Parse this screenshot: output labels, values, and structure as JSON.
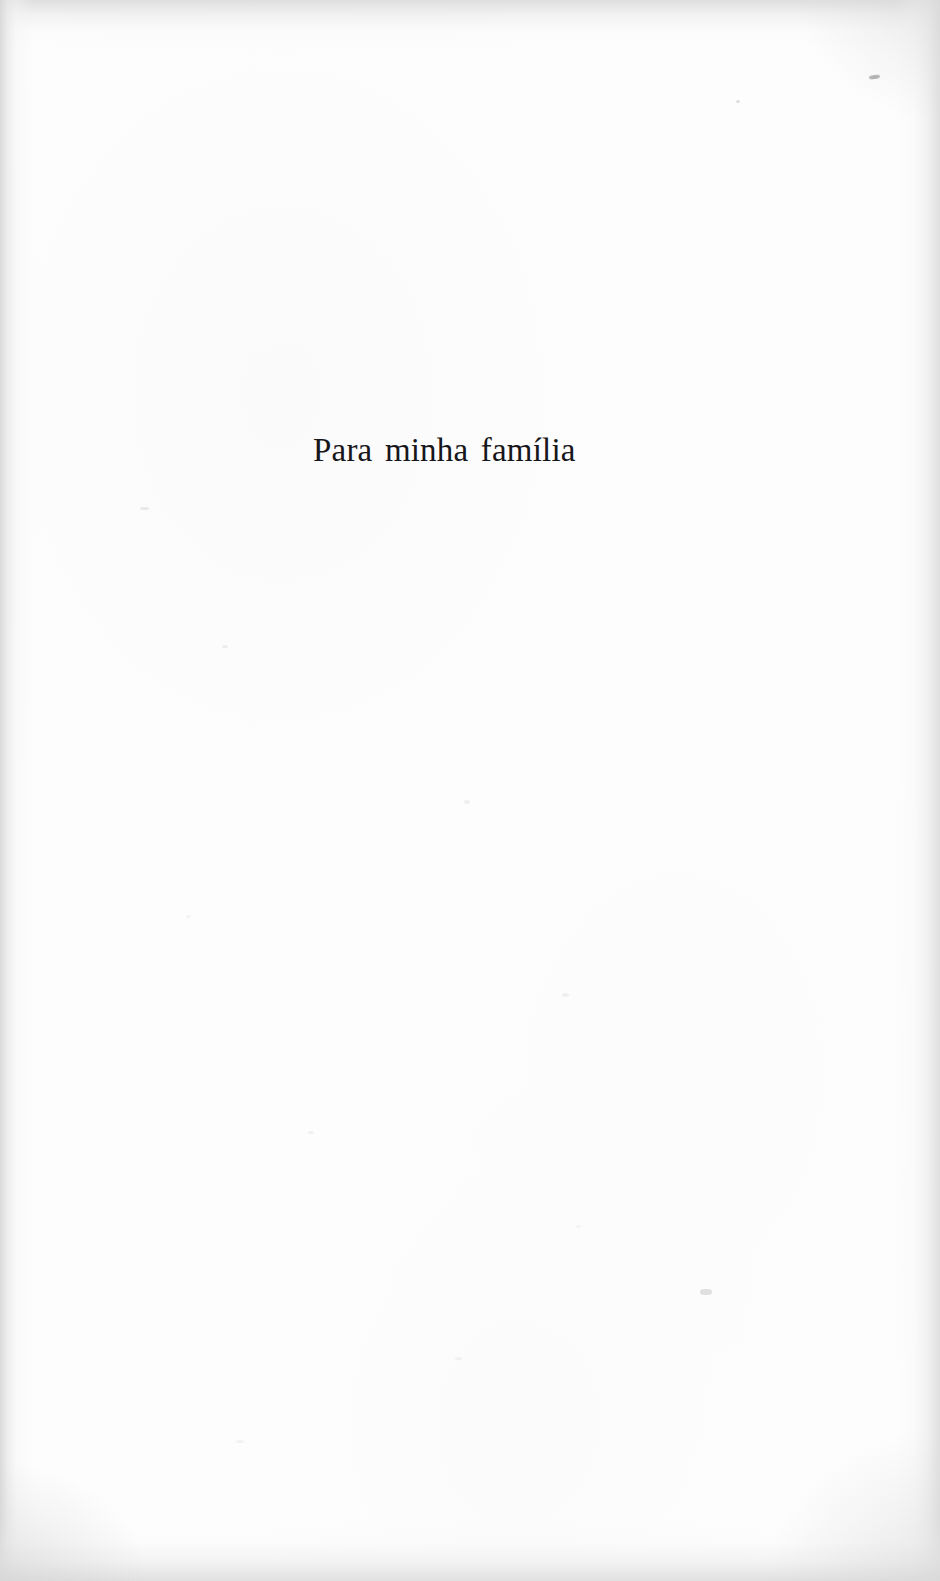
{
  "page": {
    "kind": "book-dedication-page",
    "width": 940,
    "height": 1581,
    "background_color": "#fefefe",
    "text_color": "#17161a",
    "edge_shade_color": "#d8d8d8"
  },
  "dedication": {
    "text": "Para minha família",
    "language": "pt-BR",
    "alignment": "left",
    "font_size_px": 33,
    "left_px": 313,
    "baseline_y_px": 461
  },
  "artifacts": {
    "description": "scanner edge shading and dust specks",
    "speck_count": 12
  }
}
